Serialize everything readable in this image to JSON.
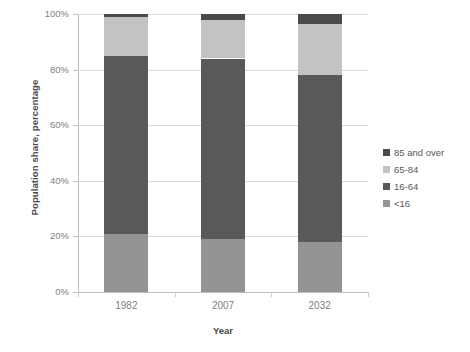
{
  "chart_data": {
    "type": "bar",
    "stacked": true,
    "stacked_mode": "percent",
    "title": "",
    "xlabel": "Year",
    "ylabel": "Population share, percentage",
    "categories": [
      "1982",
      "2007",
      "2032"
    ],
    "ylim": [
      0,
      100
    ],
    "yticks": [
      0,
      20,
      40,
      60,
      80,
      100
    ],
    "ytick_labels": [
      "0%",
      "20%",
      "40%",
      "60%",
      "80%",
      "100%"
    ],
    "grid": true,
    "legend_position": "right",
    "series": [
      {
        "name": "85 and over",
        "color": "#4a4a4a",
        "values": [
          1.0,
          2.0,
          3.5
        ]
      },
      {
        "name": "65-84",
        "color": "#c3c3c3",
        "values": [
          14.0,
          14.0,
          18.5
        ]
      },
      {
        "name": "16-64",
        "color": "#595959",
        "values": [
          64.0,
          65.0,
          60.0
        ]
      },
      {
        "name": "<16",
        "color": "#949494",
        "values": [
          21.0,
          19.0,
          18.0
        ]
      }
    ],
    "stack_order_bottom_to_top": [
      "<16",
      "16-64",
      "65-84",
      "85 and over"
    ]
  },
  "axes": {
    "y_title": "Population share, percentage",
    "x_title": "Year",
    "y_tick_labels": [
      "100%",
      "80%",
      "60%",
      "40%",
      "20%",
      "0%"
    ],
    "x_tick_labels": [
      "1982",
      "2007",
      "2032"
    ]
  },
  "legend": {
    "items": [
      {
        "label": "85 and over",
        "color": "#4a4a4a"
      },
      {
        "label": "65-84",
        "color": "#c3c3c3"
      },
      {
        "label": "16-64",
        "color": "#595959"
      },
      {
        "label": "<16",
        "color": "#949494"
      }
    ]
  },
  "colors": {
    "background": "#ffffff",
    "gridline": "#d9d9d9",
    "axis": "#bfbfbf",
    "tick_text": "#808080",
    "title_text": "#4a4a4a"
  }
}
